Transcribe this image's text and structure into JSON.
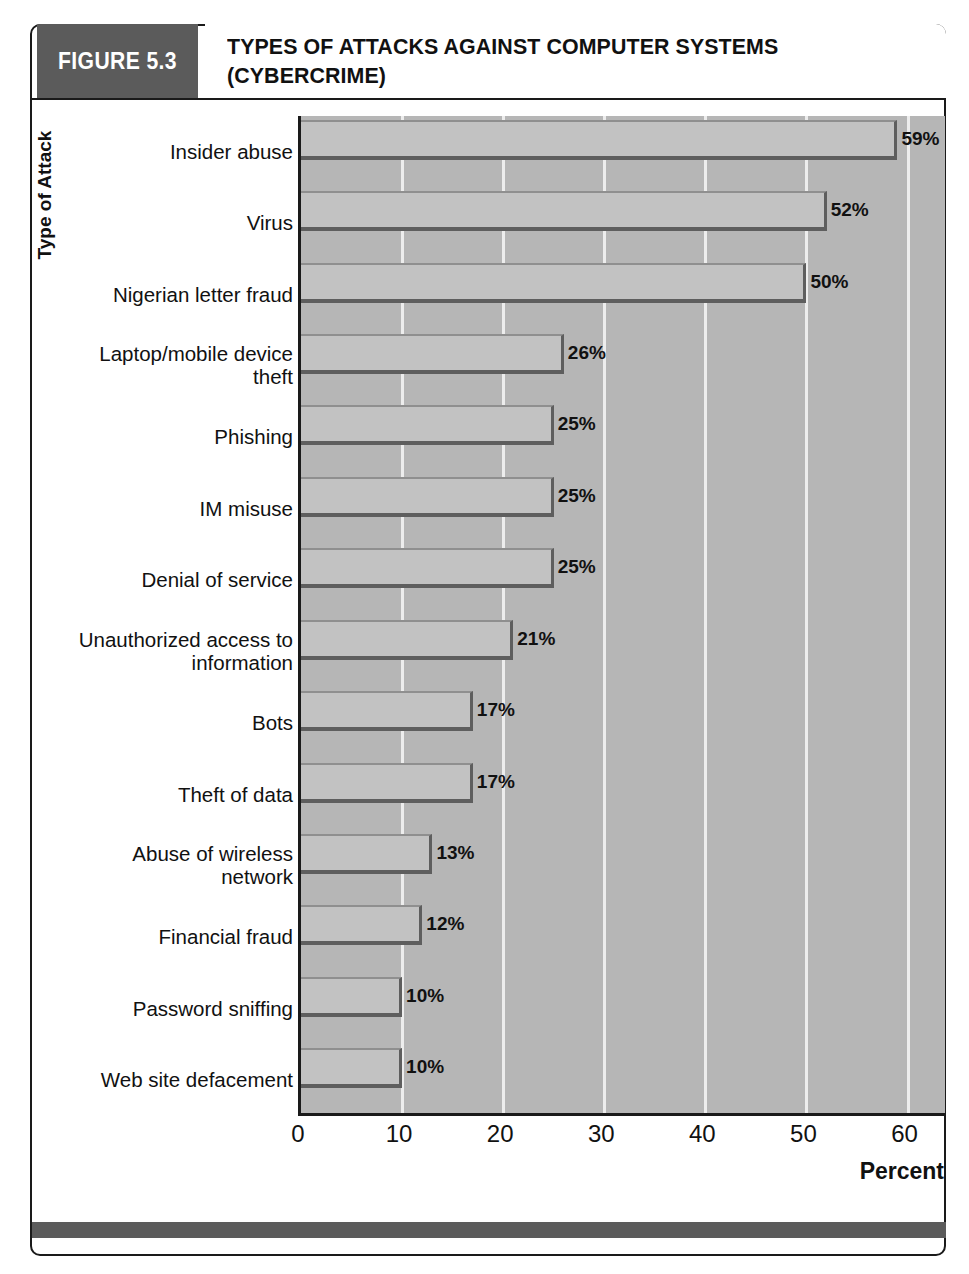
{
  "figure": {
    "badge": "FIGURE 5.3",
    "title_line1": "TYPES OF ATTACKS AGAINST COMPUTER SYSTEMS",
    "title_line2": "(CYBERCRIME)",
    "badge_color": "#5b5b5b",
    "plot_background": "#b6b6b6",
    "bar_fill": "#c2c2c2",
    "bar_shadow": "#5e5e5e",
    "gridline_color": "#ededed"
  },
  "chart_data": {
    "type": "bar",
    "orientation": "horizontal",
    "title": "TYPES OF ATTACKS AGAINST COMPUTER SYSTEMS (CYBERCRIME)",
    "xlabel": "Percent",
    "ylabel": "Type of Attack",
    "xlim": [
      0,
      64
    ],
    "xticks": [
      0,
      10,
      20,
      30,
      40,
      50,
      60
    ],
    "xticklabels": [
      "0",
      "10",
      "20",
      "30",
      "40",
      "50",
      "60"
    ],
    "grid": "vertical",
    "legend": "none",
    "categories": [
      "Insider abuse",
      "Virus",
      "Nigerian letter fraud",
      "Laptop/mobile device theft",
      "Phishing",
      "IM misuse",
      "Denial of service",
      "Unauthorized access to information",
      "Bots",
      "Theft of data",
      "Abuse of wireless network",
      "Financial fraud",
      "Password sniffing",
      "Web site defacement"
    ],
    "values": [
      59,
      52,
      50,
      26,
      25,
      25,
      25,
      21,
      17,
      17,
      13,
      12,
      10,
      10
    ],
    "value_labels": [
      "59%",
      "52%",
      "50%",
      "26%",
      "25%",
      "25%",
      "25%",
      "21%",
      "17%",
      "17%",
      "13%",
      "12%",
      "10%",
      "10%"
    ],
    "category_label_lines": [
      [
        "Insider abuse"
      ],
      [
        "Virus"
      ],
      [
        "Nigerian letter fraud"
      ],
      [
        "Laptop/mobile device",
        "theft"
      ],
      [
        "Phishing"
      ],
      [
        "IM misuse"
      ],
      [
        "Denial of service"
      ],
      [
        "Unauthorized access to",
        "information"
      ],
      [
        "Bots"
      ],
      [
        "Theft of data"
      ],
      [
        "Abuse of wireless",
        "network"
      ],
      [
        "Financial fraud"
      ],
      [
        "Password sniffing"
      ],
      [
        "Web site defacement"
      ]
    ]
  }
}
